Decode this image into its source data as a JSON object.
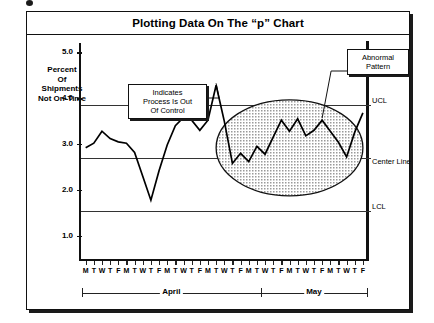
{
  "figure": {
    "title": "Plotting Data On The “p” Chart"
  },
  "axis": {
    "y_title_lines": [
      "Percent",
      "Of",
      "Shipments",
      "Not On-Time"
    ],
    "y_ticks": [
      "5.0",
      "4.0",
      "3.0",
      "2.0",
      "1.0"
    ]
  },
  "annotations": {
    "out_of_control": "Indicates Process Is Out Of Control",
    "out_of_control_lines": [
      "Indicates",
      "Process Is Out",
      "Of Control"
    ],
    "abnormal": "Abnormal Pattern",
    "abnormal_lines": [
      "Abnormal",
      "Pattern"
    ]
  },
  "limits": {
    "ucl_label": "UCL",
    "center_label": "Center Line",
    "lcl_label": "LCL"
  },
  "months": {
    "first": "April",
    "second": "May"
  },
  "chart_data": {
    "type": "line",
    "title": "Plotting Data On The “p” Chart",
    "xlabel": "",
    "ylabel": "Percent Of Shipments Not On-Time",
    "ylim": [
      0.5,
      5.2
    ],
    "y_ticks": [
      5.0,
      4.0,
      3.0,
      2.0,
      1.0
    ],
    "grid": false,
    "legend_position": "none",
    "control_limits": {
      "UCL": 3.85,
      "center_line": 2.7,
      "LCL": 1.55
    },
    "x_tick_labels": [
      "M",
      "T",
      "W",
      "T",
      "F",
      "M",
      "T",
      "W",
      "T",
      "F",
      "M",
      "T",
      "W",
      "T",
      "F",
      "M",
      "T",
      "W",
      "T",
      "F",
      "M",
      "T",
      "W",
      "T",
      "F",
      "M",
      "T",
      "W",
      "T",
      "F",
      "M",
      "T",
      "W",
      "T",
      "F"
    ],
    "month_groups": [
      {
        "label": "April",
        "start_index": 0,
        "end_index": 21
      },
      {
        "label": "May",
        "start_index": 22,
        "end_index": 34
      }
    ],
    "values": [
      2.92,
      3.02,
      3.28,
      3.12,
      3.05,
      3.02,
      2.82,
      2.3,
      1.78,
      2.42,
      2.98,
      3.4,
      3.58,
      3.52,
      3.3,
      3.52,
      4.28,
      3.5,
      2.58,
      2.8,
      2.62,
      2.95,
      2.78,
      3.15,
      3.52,
      3.28,
      3.55,
      3.18,
      3.3,
      3.52,
      3.28,
      3.04,
      2.72,
      3.26,
      3.68
    ],
    "annotations": [
      {
        "text": "Indicates Process Is Out Of Control",
        "points_to_index": 16
      },
      {
        "text": "Abnormal Pattern",
        "points_to_index": 29
      }
    ],
    "highlight_region": {
      "shape": "ellipse",
      "description": "shaded ellipse marking abnormal run",
      "start_index": 17,
      "end_index": 33
    }
  }
}
